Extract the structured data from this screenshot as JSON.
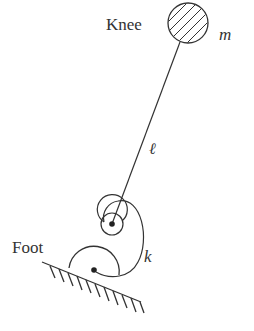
{
  "diagram": {
    "type": "mechanical-schematic",
    "labels": {
      "knee": "Knee",
      "mass": "m",
      "length": "ℓ",
      "spring": "k",
      "foot": "Foot"
    },
    "elements": [
      {
        "id": "knee-mass",
        "shape": "hatched-circle",
        "label": "Knee",
        "symbol": "m"
      },
      {
        "id": "leg-link",
        "shape": "line",
        "symbol": "ℓ"
      },
      {
        "id": "torsion-spring",
        "shape": "spiral",
        "symbol": "k"
      },
      {
        "id": "foot",
        "shape": "semicircle",
        "label": "Foot"
      },
      {
        "id": "ground",
        "shape": "hatched-line",
        "inclined": true
      }
    ],
    "colors": {
      "stroke": "#333333",
      "background": "#ffffff"
    }
  }
}
